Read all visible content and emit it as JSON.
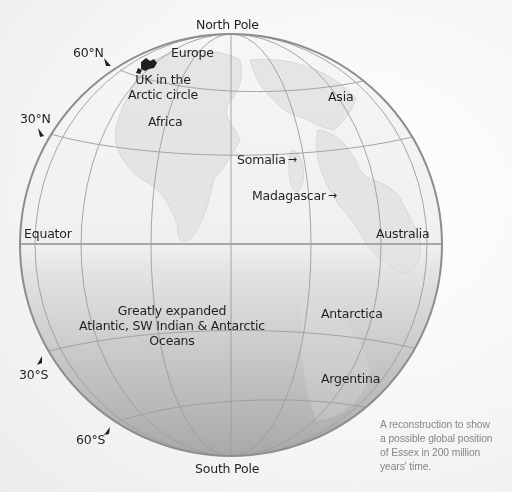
{
  "map": {
    "projection": "orthographic globe",
    "poles": {
      "north": "North Pole",
      "south": "South Pole"
    },
    "latitude_markers": [
      {
        "label": "60°N",
        "icon": "pointer-triangle"
      },
      {
        "label": "30°N",
        "icon": "pointer-triangle"
      },
      {
        "label": "Equator"
      },
      {
        "label": "30°S",
        "icon": "pointer-triangle"
      },
      {
        "label": "60°S",
        "icon": "pointer-triangle"
      }
    ],
    "regions": {
      "europe": "Europe",
      "uk": "UK in the\nArctic circle",
      "uk_line1": "UK in the",
      "uk_line2": "Arctic circle",
      "africa": "Africa",
      "asia": "Asia",
      "somalia": "Somalia",
      "madagascar": "Madagascar",
      "australia": "Australia",
      "antarctica": "Antarctica",
      "argentina": "Argentina"
    },
    "arrow_glyph": "→",
    "ocean_note": {
      "line1": "Greatly expanded",
      "line2": "Atlantic, SW Indian & Antarctic",
      "line3": "Oceans"
    },
    "colors": {
      "globe_north_top": "#f4f4f4",
      "globe_south_bottom": "#a9a9a9",
      "grid_line": "#9a9a9a",
      "equator_line": "#a8a8a8",
      "outline": "#8a8a8a",
      "landmass": "#dcdcdc",
      "uk_marker": "#231f20",
      "caption_text": "#8a8486"
    }
  },
  "caption": {
    "line1": "A reconstruction to show",
    "line2": "a possible global position",
    "line3": "of Essex in 200 million",
    "line4": "years' time."
  }
}
